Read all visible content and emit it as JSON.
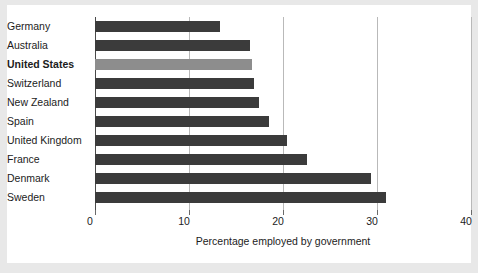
{
  "chart_data": {
    "type": "bar",
    "orientation": "horizontal",
    "title": "",
    "subtitle": "",
    "xlabel": "Percentage employed by government",
    "ylabel": "",
    "xlim": [
      0,
      40
    ],
    "xticks": [
      0,
      10,
      20,
      30,
      40
    ],
    "xticklabels": [
      "0",
      "10",
      "20",
      "30",
      "40"
    ],
    "grid": "vertical",
    "legend": "none",
    "categories": [
      "Germany",
      "Australia",
      "United States",
      "Switzerland",
      "New Zealand",
      "Spain",
      "United Kingdom",
      "France",
      "Denmark",
      "Sweden"
    ],
    "values": [
      13.3,
      16.5,
      16.7,
      16.9,
      17.4,
      18.5,
      20.4,
      22.6,
      29.4,
      31.0
    ],
    "highlight_category": "United States",
    "colors": {
      "bar": "#3b3b3b",
      "bar_highlight": "#8d8d8d",
      "gridline": "#b9b9b9",
      "axis": "#4a4a4a",
      "text": "#1c1c1c",
      "card_background": "#ffffff",
      "figure_background": "#e8e8e8"
    }
  }
}
